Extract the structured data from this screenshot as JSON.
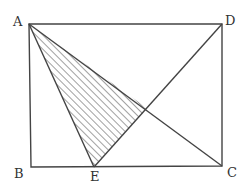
{
  "diagram": {
    "type": "geometry",
    "points": {
      "A": {
        "label": "A",
        "x": 29,
        "y": 24
      },
      "B": {
        "label": "B",
        "x": 31,
        "y": 167
      },
      "C": {
        "label": "C",
        "x": 222,
        "y": 166
      },
      "D": {
        "label": "D",
        "x": 222,
        "y": 24
      },
      "E": {
        "label": "E",
        "x": 94,
        "y": 167
      }
    },
    "segments": [
      "AB",
      "BC",
      "CD",
      "DA",
      "AC",
      "AE",
      "DE"
    ],
    "shaded_region": {
      "vertices": [
        "A",
        "E",
        "F"
      ],
      "pattern": "diagonal-hatch"
    },
    "colors": {
      "stroke": "#444444",
      "label": "#333333",
      "background": "#ffffff"
    }
  }
}
